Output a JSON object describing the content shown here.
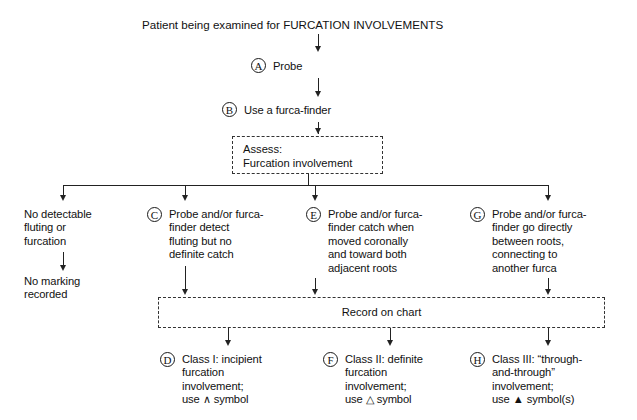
{
  "figure": {
    "heading": "Patient being examined for FURCATION INVOLVEMENTS"
  },
  "steps": {
    "a": {
      "marker": "A",
      "label": "Probe"
    },
    "b": {
      "marker": "B",
      "label": "Use a furca-finder"
    }
  },
  "assess_box": {
    "label": "Assess:\n   Furcation involvement"
  },
  "branches": {
    "none": {
      "condition": "No detectable\nfluting or\nfurcation",
      "outcome": "No marking\nrecorded"
    },
    "c": {
      "marker": "C",
      "condition": "Probe and/or furca-\nfinder detect\nfluting but no\ndefinite catch"
    },
    "e": {
      "marker": "E",
      "condition": "Probe and/or furca-\nfinder catch when\nmoved coronally\nand toward both\nadjacent roots"
    },
    "g": {
      "marker": "G",
      "condition": "Probe and/or furca-\nfinder go directly\nbetween roots,\nconnecting to\nanother furca"
    }
  },
  "record_box": {
    "label": "Record on chart"
  },
  "results": {
    "d": {
      "marker": "D",
      "label": "Class I: incipient\nfurcation\ninvolvement;\nuse ∧ symbol"
    },
    "f": {
      "marker": "F",
      "label": "Class II: definite\nfurcation\ninvolvement;\nuse △ symbol"
    },
    "h": {
      "marker": "H",
      "label": "Class III: “through-\nand-through”\ninvolvement;\nuse ▲ symbol(s)"
    }
  },
  "colors": {
    "ink": "#111111",
    "line": "#222222",
    "dashed": "#333333",
    "background": "#ffffff"
  }
}
